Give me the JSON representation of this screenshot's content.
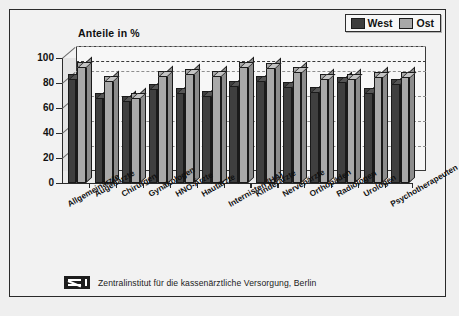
{
  "chart_data": {
    "type": "bar",
    "title": "Anteile in %",
    "xlabel": "",
    "ylabel": "Anteile in %",
    "ylim": [
      0,
      100
    ],
    "yticks": [
      0,
      20,
      40,
      60,
      80,
      100
    ],
    "grid": true,
    "legend_position": "top-right",
    "reference_line": 88,
    "categories": [
      "Allgemeinärzte",
      "Augenärzte",
      "Chirurgen",
      "Gynäkologen",
      "HNO-Ärzte",
      "Hautärzte",
      "Internisten (HA)",
      "Kinderärzte",
      "Nervenärzte",
      "Orthopäden",
      "Radiologen",
      "Urologen",
      "Psychotherapeuten"
    ],
    "series": [
      {
        "name": "West",
        "color": "#3f3f3f",
        "values": [
          87,
          72,
          70,
          79,
          76,
          74,
          82,
          86,
          81,
          77,
          85,
          76,
          83
        ]
      },
      {
        "name": "Ost",
        "color": "#a9a9a9",
        "values": [
          97,
          86,
          72,
          90,
          91,
          90,
          97,
          96,
          93,
          87,
          87,
          89,
          89
        ]
      }
    ]
  },
  "legend": {
    "items": [
      {
        "label": "West",
        "color": "#3f3f3f"
      },
      {
        "label": "Ost",
        "color": "#a9a9a9"
      }
    ]
  },
  "footer": {
    "logo_text": "ZI",
    "source": "Zentralinstitut für die kassenärztliche Versorgung, Berlin"
  }
}
